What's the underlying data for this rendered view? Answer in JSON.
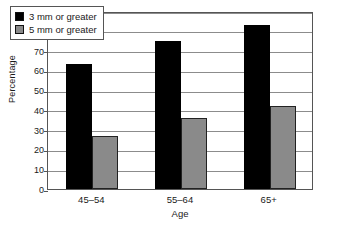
{
  "chart_data": {
    "type": "bar",
    "title": "",
    "subtitle": "",
    "xlabel": "Age",
    "ylabel": "Percentage",
    "categories": [
      "45–54",
      "55–64",
      "65+"
    ],
    "series": [
      {
        "name": "3 mm or greater",
        "color": "#000000",
        "values": [
          63,
          75,
          83
        ]
      },
      {
        "name": "5 mm or greater",
        "color": "#8a8a8a",
        "values": [
          27,
          36,
          42
        ]
      }
    ],
    "ylim": [
      0,
      90
    ],
    "ytick_step": 10,
    "yticks": [
      "0",
      "10",
      "20",
      "30",
      "40",
      "50",
      "60",
      "70",
      "80",
      "90"
    ],
    "grid": "horizontal",
    "legend_position": "upper-left-inside",
    "frame": true
  }
}
